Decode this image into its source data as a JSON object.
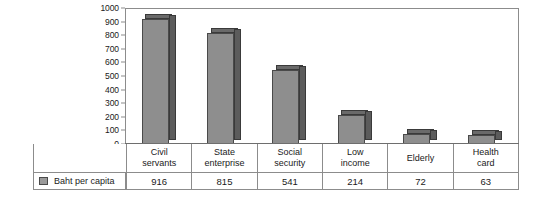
{
  "chart_data": {
    "type": "bar",
    "title": "",
    "subtitle": "",
    "xlabel": "",
    "ylabel": "",
    "categories": [
      "Civil servants",
      "State enterprise",
      "Social security",
      "Low income",
      "Elderly",
      "Health card"
    ],
    "category_lines": [
      [
        "Civil",
        "servants"
      ],
      [
        "State",
        "enterprise"
      ],
      [
        "Social",
        "security"
      ],
      [
        "Low",
        "income"
      ],
      [
        "Elderly"
      ],
      [
        "Health",
        "card"
      ]
    ],
    "series": [
      {
        "name": "Baht per capita",
        "values": [
          916,
          815,
          541,
          214,
          72,
          63
        ]
      }
    ],
    "values": [
      916,
      815,
      541,
      214,
      72,
      63
    ],
    "ylim": [
      0,
      1000
    ],
    "ytick_labels": [
      "1000",
      "900",
      "800",
      "700",
      "600",
      "500",
      "400",
      "300",
      "200",
      "100",
      "0"
    ],
    "ytick_values": [
      1000,
      900,
      800,
      700,
      600,
      500,
      400,
      300,
      200,
      100,
      0
    ],
    "grid": false,
    "legend_position": "data-table-left",
    "data_table": {
      "row_label": "Baht per capita",
      "values": [
        "916",
        "815",
        "541",
        "214",
        "72",
        "63"
      ]
    },
    "colors": {
      "bar_front": "#8e8e8e",
      "bar_side": "#5c5c5c",
      "bar_top": "#6a6a6a",
      "bar_outline": "#4a4a4a",
      "frame": "#8c8c8c",
      "background": "#ffffff",
      "text": "#1a1a1a"
    }
  }
}
